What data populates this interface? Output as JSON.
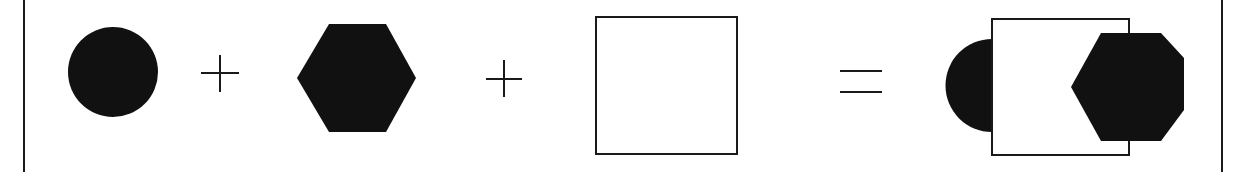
{
  "diagram": {
    "colors": {
      "fill": "#111111",
      "stroke": "#1a1a1a",
      "background": "#ffffff"
    },
    "operators": [
      "+",
      "+",
      "="
    ],
    "terms": [
      {
        "shape": "circle",
        "style": "filled"
      },
      {
        "shape": "hexagon",
        "style": "filled"
      },
      {
        "shape": "square",
        "style": "outline"
      }
    ],
    "result": {
      "shape": "composite",
      "components": [
        "half-circle on left edge of square",
        "square outline",
        "hexagon overlapping right edge of square"
      ]
    }
  }
}
